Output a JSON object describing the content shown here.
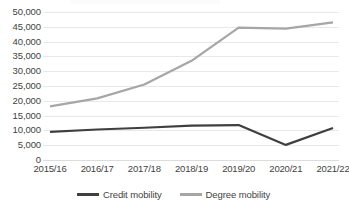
{
  "chart_data": {
    "type": "line",
    "title": "",
    "subtitle": "",
    "xlabel": "",
    "ylabel": "",
    "categories": [
      "2015/16",
      "2016/17",
      "2017/18",
      "2018/19",
      "2019/20",
      "2020/21",
      "2021/22"
    ],
    "series": [
      {
        "name": "Credit mobility",
        "color": "#3f3f3f",
        "values": [
          9500,
          10300,
          10900,
          11600,
          11800,
          5100,
          10800
        ]
      },
      {
        "name": "Degree mobility",
        "color": "#a6a6a6",
        "values": [
          18100,
          20800,
          25500,
          33500,
          44700,
          44400,
          46500
        ]
      }
    ],
    "ylim": [
      0,
      50000
    ],
    "ytick_step": 5000,
    "ytick_labels": [
      "50,000",
      "45,000",
      "40,000",
      "35,000",
      "30,000",
      "25,000",
      "20,000",
      "15,000",
      "10,000",
      "5,000",
      "0"
    ],
    "ytick_values": [
      50000,
      45000,
      40000,
      35000,
      30000,
      25000,
      20000,
      15000,
      10000,
      5000,
      0
    ],
    "grid": true,
    "grid_axis": "y",
    "legend_position": "bottom",
    "legend": [
      {
        "label": "Credit mobility",
        "color": "#3f3f3f"
      },
      {
        "label": "Degree mobility",
        "color": "#a6a6a6"
      }
    ]
  }
}
